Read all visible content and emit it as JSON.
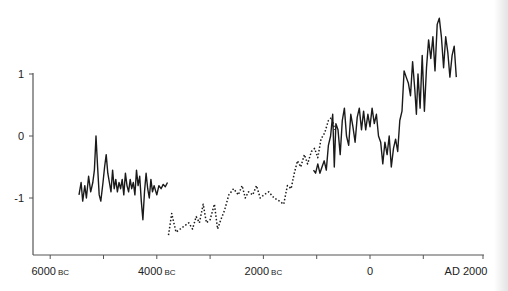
{
  "chart_data": {
    "type": "line",
    "title": "",
    "xlabel": "",
    "ylabel": "",
    "xlim": [
      -6400,
      2100
    ],
    "ylim": [
      -1.9,
      1.4
    ],
    "grid": false,
    "legend": null,
    "x_ticks": [
      {
        "value": -6000,
        "label": "6000",
        "suffix": "BC"
      },
      {
        "value": -5000,
        "label": "",
        "suffix": ""
      },
      {
        "value": -4000,
        "label": "4000",
        "suffix": "BC"
      },
      {
        "value": -3000,
        "label": "",
        "suffix": ""
      },
      {
        "value": -2000,
        "label": "2000",
        "suffix": "BC"
      },
      {
        "value": -1000,
        "label": "",
        "suffix": ""
      },
      {
        "value": 0,
        "label": "0",
        "suffix": ""
      },
      {
        "value": 1000,
        "label": "",
        "suffix": ""
      },
      {
        "value": 2000,
        "label": "AD 2000",
        "suffix": ""
      }
    ],
    "y_ticks": [
      {
        "value": 1,
        "label": "1"
      },
      {
        "value": 0,
        "label": "0"
      },
      {
        "value": -1,
        "label": "-1"
      }
    ],
    "series": [
      {
        "name": "early-record",
        "style": "solid",
        "points": [
          [
            -5460,
            -0.95
          ],
          [
            -5420,
            -0.75
          ],
          [
            -5390,
            -1.05
          ],
          [
            -5350,
            -0.8
          ],
          [
            -5320,
            -1.0
          ],
          [
            -5280,
            -0.65
          ],
          [
            -5240,
            -0.9
          ],
          [
            -5200,
            -0.75
          ],
          [
            -5170,
            -0.55
          ],
          [
            -5140,
            0.0
          ],
          [
            -5110,
            -0.5
          ],
          [
            -5080,
            -0.95
          ],
          [
            -5050,
            -1.05
          ],
          [
            -5010,
            -0.75
          ],
          [
            -4980,
            -0.5
          ],
          [
            -4950,
            -0.3
          ],
          [
            -4920,
            -0.6
          ],
          [
            -4890,
            -0.75
          ],
          [
            -4860,
            -0.9
          ],
          [
            -4830,
            -0.55
          ],
          [
            -4800,
            -0.85
          ],
          [
            -4770,
            -0.7
          ],
          [
            -4740,
            -0.9
          ],
          [
            -4710,
            -0.75
          ],
          [
            -4680,
            -0.85
          ],
          [
            -4650,
            -0.7
          ],
          [
            -4620,
            -0.95
          ],
          [
            -4590,
            -0.6
          ],
          [
            -4560,
            -0.8
          ],
          [
            -4530,
            -0.9
          ],
          [
            -4500,
            -0.7
          ],
          [
            -4470,
            -0.85
          ],
          [
            -4440,
            -0.75
          ],
          [
            -4410,
            -0.95
          ],
          [
            -4380,
            -0.55
          ],
          [
            -4350,
            -0.8
          ],
          [
            -4320,
            -0.65
          ],
          [
            -4290,
            -1.05
          ],
          [
            -4260,
            -1.35
          ],
          [
            -4230,
            -0.9
          ],
          [
            -4200,
            -0.6
          ],
          [
            -4170,
            -0.85
          ],
          [
            -4140,
            -1.0
          ],
          [
            -4110,
            -0.7
          ],
          [
            -4080,
            -0.9
          ],
          [
            -4050,
            -0.8
          ],
          [
            -4000,
            -0.95
          ],
          [
            -3960,
            -0.8
          ],
          [
            -3920,
            -0.85
          ],
          [
            -3880,
            -0.78
          ],
          [
            -3840,
            -0.82
          ],
          [
            -3800,
            -0.75
          ]
        ]
      },
      {
        "name": "middle-record",
        "style": "dotted",
        "points": [
          [
            -3780,
            -1.6
          ],
          [
            -3720,
            -1.25
          ],
          [
            -3640,
            -1.55
          ],
          [
            -3560,
            -1.5
          ],
          [
            -3480,
            -1.45
          ],
          [
            -3400,
            -1.4
          ],
          [
            -3330,
            -1.5
          ],
          [
            -3260,
            -1.3
          ],
          [
            -3200,
            -1.4
          ],
          [
            -3130,
            -1.1
          ],
          [
            -3070,
            -1.4
          ],
          [
            -3000,
            -1.35
          ],
          [
            -2920,
            -1.1
          ],
          [
            -2860,
            -1.5
          ],
          [
            -2800,
            -1.35
          ],
          [
            -2730,
            -1.2
          ],
          [
            -2650,
            -0.95
          ],
          [
            -2560,
            -0.85
          ],
          [
            -2470,
            -0.95
          ],
          [
            -2400,
            -0.8
          ],
          [
            -2340,
            -1.0
          ],
          [
            -2280,
            -0.9
          ],
          [
            -2200,
            -0.95
          ],
          [
            -2130,
            -0.8
          ],
          [
            -2060,
            -1.0
          ],
          [
            -1990,
            -0.95
          ],
          [
            -1900,
            -0.9
          ],
          [
            -1800,
            -1.0
          ],
          [
            -1700,
            -1.05
          ],
          [
            -1620,
            -1.1
          ],
          [
            -1550,
            -0.8
          ],
          [
            -1480,
            -0.85
          ],
          [
            -1420,
            -0.6
          ],
          [
            -1360,
            -0.4
          ],
          [
            -1300,
            -0.5
          ],
          [
            -1230,
            -0.3
          ],
          [
            -1170,
            -0.45
          ],
          [
            -1100,
            -0.25
          ],
          [
            -1040,
            -0.2
          ],
          [
            -980,
            -0.35
          ],
          [
            -920,
            -0.05
          ],
          [
            -850,
            0.05
          ],
          [
            -780,
            0.25
          ],
          [
            -720,
            0.3
          ],
          [
            -660,
            0.1
          ]
        ]
      },
      {
        "name": "late-record",
        "style": "solid",
        "points": [
          [
            -1060,
            -0.55
          ],
          [
            -1020,
            -0.6
          ],
          [
            -980,
            -0.45
          ],
          [
            -940,
            -0.6
          ],
          [
            -900,
            -0.5
          ],
          [
            -860,
            -0.4
          ],
          [
            -820,
            -0.55
          ],
          [
            -780,
            -0.15
          ],
          [
            -740,
            0.0
          ],
          [
            -700,
            0.35
          ],
          [
            -670,
            -0.5
          ],
          [
            -640,
            0.2
          ],
          [
            -600,
            0.1
          ],
          [
            -560,
            -0.3
          ],
          [
            -520,
            0.25
          ],
          [
            -480,
            0.45
          ],
          [
            -440,
            0.0
          ],
          [
            -400,
            -0.15
          ],
          [
            -360,
            0.35
          ],
          [
            -320,
            0.15
          ],
          [
            -280,
            -0.1
          ],
          [
            -240,
            0.3
          ],
          [
            -200,
            0.45
          ],
          [
            -160,
            0.1
          ],
          [
            -120,
            0.4
          ],
          [
            -80,
            0.1
          ],
          [
            -40,
            0.35
          ],
          [
            0,
            0.15
          ],
          [
            40,
            0.45
          ],
          [
            80,
            0.2
          ],
          [
            120,
            0.35
          ],
          [
            160,
            0.0
          ],
          [
            200,
            -0.1
          ],
          [
            240,
            -0.45
          ],
          [
            280,
            -0.1
          ],
          [
            320,
            -0.3
          ],
          [
            360,
            0.0
          ],
          [
            400,
            -0.5
          ],
          [
            440,
            -0.2
          ],
          [
            480,
            -0.05
          ],
          [
            520,
            -0.25
          ],
          [
            560,
            0.25
          ],
          [
            600,
            0.4
          ],
          [
            640,
            1.05
          ],
          [
            680,
            0.95
          ],
          [
            720,
            0.85
          ],
          [
            760,
            0.65
          ],
          [
            800,
            1.2
          ],
          [
            840,
            0.75
          ],
          [
            870,
            0.35
          ],
          [
            900,
            1.0
          ],
          [
            940,
            0.45
          ],
          [
            980,
            1.3
          ],
          [
            1020,
            0.4
          ],
          [
            1060,
            1.1
          ],
          [
            1100,
            1.55
          ],
          [
            1140,
            1.25
          ],
          [
            1180,
            1.6
          ],
          [
            1220,
            1.05
          ],
          [
            1260,
            1.8
          ],
          [
            1300,
            1.9
          ],
          [
            1340,
            1.6
          ],
          [
            1380,
            1.1
          ],
          [
            1420,
            1.6
          ],
          [
            1460,
            1.35
          ],
          [
            1500,
            0.95
          ],
          [
            1540,
            1.3
          ],
          [
            1580,
            1.45
          ],
          [
            1620,
            0.95
          ]
        ]
      }
    ]
  }
}
